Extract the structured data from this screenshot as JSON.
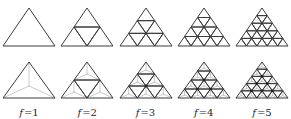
{
  "figure": {
    "frequencies": [
      1,
      2,
      3,
      4,
      5
    ],
    "rows": [
      {
        "name": "subdivided-triangles",
        "style": "plain"
      },
      {
        "name": "subdivided-triangles-with-centroid-lines",
        "style": "centroid"
      }
    ],
    "labels": [
      {
        "symbol": "f",
        "eq": "=",
        "value": "1"
      },
      {
        "symbol": "f",
        "eq": "=",
        "value": "2"
      },
      {
        "symbol": "f",
        "eq": "=",
        "value": "3"
      },
      {
        "symbol": "f",
        "eq": "=",
        "value": "4"
      },
      {
        "symbol": "f",
        "eq": "=",
        "value": "5"
      }
    ],
    "colors": {
      "background": "#ffffff",
      "line": "#3c3c3c",
      "light_line": "#b4b4b4",
      "dot": "#1e1e1e",
      "label_text": "#1f1f1f"
    }
  }
}
